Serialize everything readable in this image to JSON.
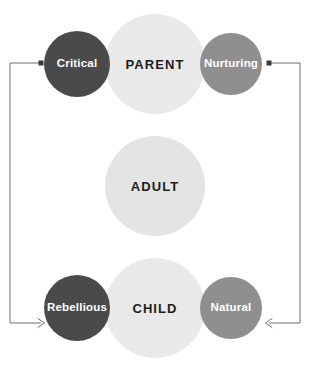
{
  "diagram": {
    "type": "ego-states-diagram",
    "background_color": "#ffffff",
    "rows": [
      {
        "id": "parent",
        "core": {
          "label": "PARENT",
          "color": "#e9e9e9",
          "text_color": "#1d1d1d",
          "cx": 155,
          "cy": 64,
          "r": 50
        },
        "left": {
          "label": "Critical",
          "color": "#4a4a4a",
          "text_color": "#ffffff",
          "cx": 77,
          "cy": 64,
          "r": 33
        },
        "right": {
          "label": "Nurturing",
          "color": "#8f8f8f",
          "text_color": "#ffffff",
          "cx": 231,
          "cy": 64,
          "r": 31
        }
      },
      {
        "id": "adult",
        "core": {
          "label": "ADULT",
          "color": "#e4e4e4",
          "text_color": "#1d1d1d",
          "cx": 155,
          "cy": 186,
          "r": 50
        },
        "left": null,
        "right": null
      },
      {
        "id": "child",
        "core": {
          "label": "CHILD",
          "color": "#e9e9e9",
          "text_color": "#1d1d1d",
          "cx": 155,
          "cy": 308,
          "r": 50
        },
        "left": {
          "label": "Rebellious",
          "color": "#4a4a4a",
          "text_color": "#ffffff",
          "cx": 77,
          "cy": 308,
          "r": 33
        },
        "right": {
          "label": "Natural",
          "color": "#8f8f8f",
          "text_color": "#ffffff",
          "cx": 231,
          "cy": 308,
          "r": 31
        }
      }
    ],
    "connectors": {
      "line_color": "#6f6f6f",
      "line_width": 1,
      "dot_color": "#3a3a3a",
      "dot_size": 5,
      "left": {
        "id": "left-connector",
        "description": "from Critical down to Rebellious",
        "start_x": 41,
        "start_y": 63,
        "corner_x": 10,
        "corner_y": 63,
        "end_x": 44,
        "end_y": 323,
        "terminal_top": "square-dot",
        "terminal_bottom": "arrowhead-right"
      },
      "right": {
        "id": "right-connector",
        "description": "from Nurturing down to Natural",
        "start_x": 269,
        "start_y": 63,
        "corner_x": 300,
        "corner_y": 63,
        "end_x": 266,
        "end_y": 323,
        "terminal_top": "square-dot",
        "terminal_bottom": "arrowhead-left"
      }
    }
  }
}
